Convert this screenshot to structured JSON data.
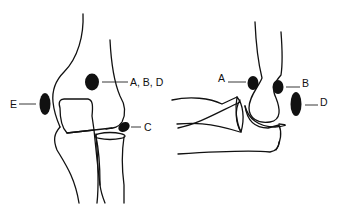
{
  "diagram": {
    "type": "anatomical line drawing",
    "views": [
      {
        "id": "frontal",
        "description": "Anteroposterior view of elbow",
        "labels": [
          {
            "id": "abd",
            "text": "A, B, D"
          },
          {
            "id": "c",
            "text": "C"
          },
          {
            "id": "e",
            "text": "E"
          }
        ]
      },
      {
        "id": "lateral",
        "description": "Lateral view of elbow",
        "labels": [
          {
            "id": "a",
            "text": "A"
          },
          {
            "id": "b",
            "text": "B"
          },
          {
            "id": "d",
            "text": "D"
          }
        ]
      }
    ],
    "colors": {
      "line": "#111111",
      "background": "#ffffff"
    }
  }
}
